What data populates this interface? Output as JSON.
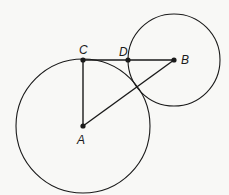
{
  "diagram": {
    "points": {
      "A": {
        "label": "A",
        "x": 83,
        "y": 126
      },
      "B": {
        "label": "B",
        "x": 174,
        "y": 60
      },
      "C": {
        "label": "C",
        "x": 83,
        "y": 60
      },
      "D": {
        "label": "D",
        "x": 128,
        "y": 60
      }
    },
    "circles": [
      {
        "center": "A",
        "r": 67
      },
      {
        "center": "B",
        "r": 46
      }
    ],
    "segments": [
      "AC",
      "CB",
      "AB"
    ],
    "colors": {
      "stroke": "#1a1a1a",
      "background": "#f8f8f6"
    }
  }
}
